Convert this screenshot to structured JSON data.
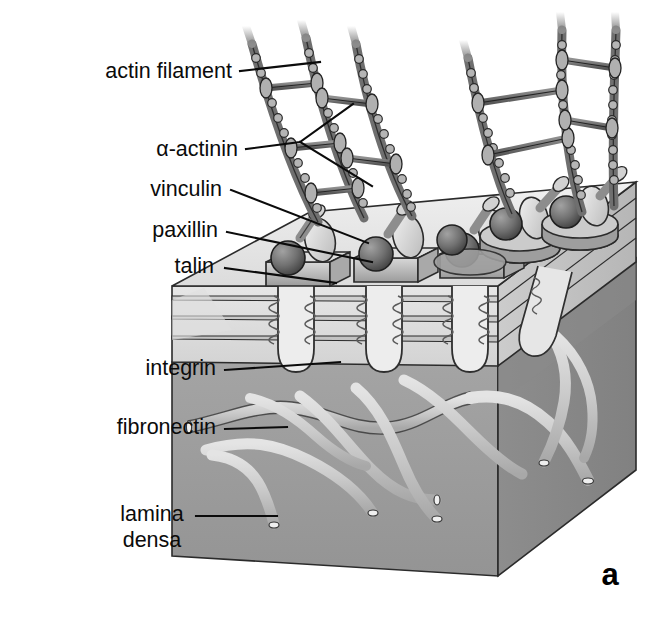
{
  "figure": {
    "panel_label": "a",
    "background_color": "#ffffff"
  },
  "labels": [
    {
      "id": "actin-filament",
      "text": "actin filament",
      "x": 232,
      "y": 78,
      "align": "end",
      "leader": [
        [
          240,
          71
        ],
        [
          320,
          62
        ]
      ]
    },
    {
      "id": "alpha-actinin",
      "text": "α-actinin",
      "x": 238,
      "y": 156,
      "align": "end",
      "leader": [
        [
          246,
          149
        ],
        [
          300,
          142
        ],
        [
          353,
          104
        ]
      ],
      "leader2": [
        [
          300,
          142
        ],
        [
          372,
          186
        ]
      ]
    },
    {
      "id": "vinculin",
      "text": "vinculin",
      "x": 222,
      "y": 196,
      "align": "end",
      "leader": [
        [
          231,
          190
        ],
        [
          368,
          243
        ]
      ]
    },
    {
      "id": "paxillin",
      "text": "paxillin",
      "x": 218,
      "y": 237,
      "align": "end",
      "leader": [
        [
          227,
          232
        ],
        [
          372,
          262
        ]
      ]
    },
    {
      "id": "talin",
      "text": "talin",
      "x": 214,
      "y": 273,
      "align": "end",
      "leader": [
        [
          225,
          268
        ],
        [
          336,
          283
        ]
      ]
    },
    {
      "id": "integrin",
      "text": "integrin",
      "x": 216,
      "y": 375,
      "align": "end",
      "leader": [
        [
          225,
          370
        ],
        [
          340,
          362
        ]
      ]
    },
    {
      "id": "fibronectin",
      "text": "fibronectin",
      "x": 216,
      "y": 434,
      "align": "end",
      "leader": [
        [
          225,
          429
        ],
        [
          287,
          427
        ]
      ]
    },
    {
      "id": "lamina-densa-1",
      "text": "lamina",
      "x": 152,
      "y": 521,
      "align": "middle",
      "leader": [
        [
          196,
          516
        ],
        [
          277,
          516
        ]
      ]
    },
    {
      "id": "lamina-densa-2",
      "text": "densa",
      "x": 152,
      "y": 547,
      "align": "middle",
      "leader": null
    }
  ],
  "colors": {
    "ink": "#0b0b0b",
    "lamina_densa": "#9d9d9d",
    "lamina_shadow": "#8a8a8a",
    "membrane_light": "#e3e3e3",
    "membrane_mid": "#d4d4d4",
    "membrane_dark": "#c2c2c2",
    "membrane_top": "#ededed",
    "protein_light": "#e8e8e8",
    "protein_mid": "#b4b4b4",
    "protein_dark": "#5a5a5a",
    "paxillin_sphere": "#6d6d6d",
    "actin_gray": "#9a9a9a",
    "fibronectin": "#cfcfcf"
  },
  "structures": {
    "actin_filaments": {
      "name": "actin filament",
      "count": 6,
      "description": "beaded double-helix strands rising from adhesion plaques"
    },
    "alpha_actinin_crosslinks": {
      "name": "α-actinin",
      "count": 9,
      "description": "short rod crosslinkers with knobbed ends joining adjacent actin filaments"
    },
    "adhesion_plaques": {
      "name": "adhesion plaque",
      "count": 6,
      "description": "talin plate with paxillin sphere and vinculin oval on the membrane surface"
    },
    "integrin_hairpins": {
      "name": "integrin",
      "count": 6,
      "description": "coiled transmembrane hairpin loops spanning the membrane layers"
    },
    "fibronectin_fibrils": {
      "name": "fibronectin",
      "count": 9,
      "description": "cylindrical fibrils with cut ends woven through the lamina densa"
    },
    "membrane_layers": {
      "name": "plasma membrane",
      "count": 4,
      "description": "stratified horizontal bands forming the cell membrane slab"
    },
    "lamina_densa_block": {
      "name": "lamina densa",
      "description": "gray extracellular matrix block beneath the membrane"
    }
  }
}
